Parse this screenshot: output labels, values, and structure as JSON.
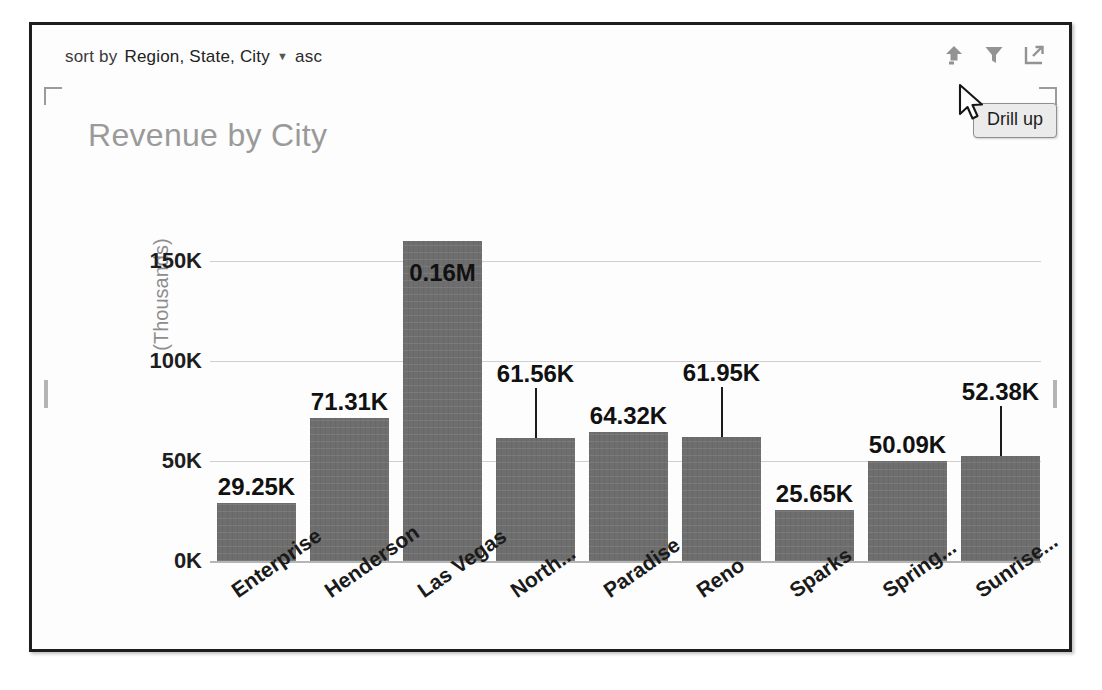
{
  "visual": {
    "sort_bar": {
      "label": "sort by",
      "fields": "Region, State, City",
      "caret": "▼",
      "direction": "asc"
    },
    "header_icons": [
      {
        "name": "drill-up-icon",
        "title": "Drill up"
      },
      {
        "name": "filter-icon",
        "title": "Filters"
      },
      {
        "name": "focus-mode-icon",
        "title": "Focus mode"
      }
    ],
    "tooltip": {
      "text": "Drill up"
    },
    "colors": {
      "bar": "#6e6e6e",
      "title": "#9a9a9a",
      "gridline": "#cfcfcf",
      "axis_title": "#8d8d8d",
      "border": "#1d1d1d",
      "tooltip_bg": "#ebebeb"
    }
  },
  "chart_data": {
    "type": "bar",
    "title": "Revenue by City",
    "xlabel": "",
    "ylabel": "(Thousands)",
    "categories": [
      "Enterprise",
      "Henderson",
      "Las Vegas",
      "North...",
      "Paradise",
      "Reno",
      "Sparks",
      "Spring...",
      "Sunrise..."
    ],
    "values": [
      29250,
      71310,
      160000,
      61560,
      64320,
      61950,
      25650,
      50090,
      52380
    ],
    "data_labels": [
      "29.25K",
      "71.31K",
      "0.16M",
      "61.56K",
      "64.32K",
      "61.95K",
      "25.65K",
      "50.09K",
      "52.38K"
    ],
    "ylim": [
      0,
      175000
    ],
    "yticks": [
      0,
      50000,
      100000,
      150000
    ],
    "ytick_labels": [
      "0K",
      "50K",
      "100K",
      "150K"
    ],
    "grid": true,
    "legend": false
  }
}
